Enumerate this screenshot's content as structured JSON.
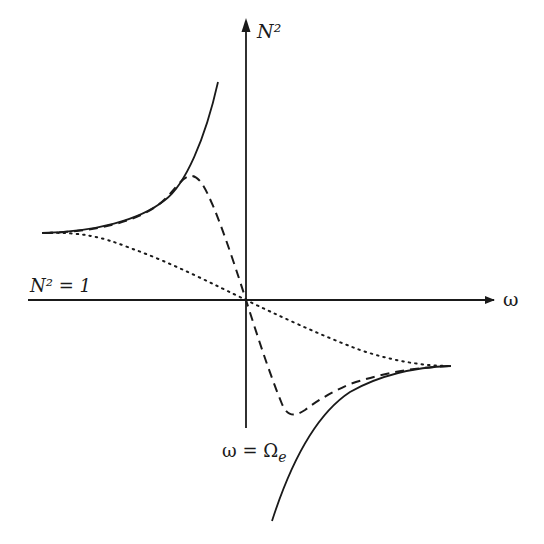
{
  "figure": {
    "type": "dispersion-diagram",
    "background": "#ffffff",
    "ink_color": "#1a1a1a",
    "axes": {
      "y_label": "N²",
      "x_label": "ω",
      "horizontal_line_label": "N² = 1",
      "vertical_line_label": "ω = Ωe",
      "vertical_label_main": "ω = Ω",
      "vertical_label_sub": "e"
    },
    "curves": [
      {
        "name": "solid",
        "style": "solid",
        "description": "Cold plasma resonance branches diverging at ω = Ωe"
      },
      {
        "name": "dashed",
        "style": "dashed",
        "description": "Finite-damping curve with peak and trough near resonance"
      },
      {
        "name": "dotted",
        "style": "dotted",
        "description": "Strong-damping smooth transition curve"
      }
    ]
  }
}
